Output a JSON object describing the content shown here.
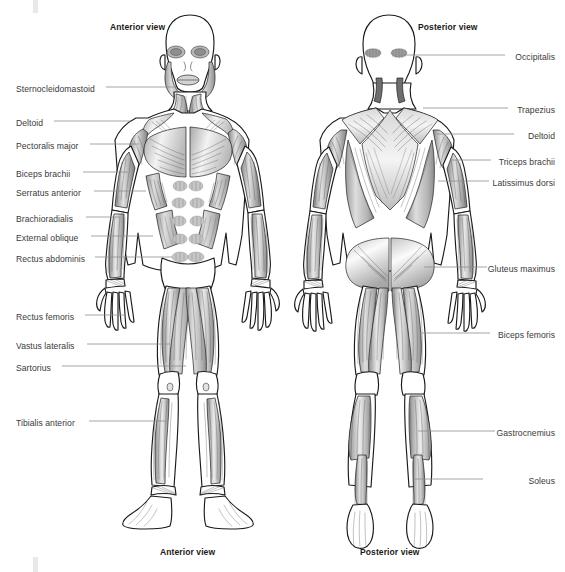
{
  "page": {
    "background_color": "#ffffff",
    "width": 565,
    "height": 572,
    "label_color": "#3a3a3a",
    "leader_line_color": "#8d8d8d",
    "outline_color": "#1a1a1a",
    "muscle_fill_light": "#f2f2f2",
    "muscle_fill_mid": "#c9c9c9",
    "muscle_fill_dark": "#8f8f8f"
  },
  "headers": {
    "anterior_top": "Anterior view",
    "posterior_top": "Posterior view"
  },
  "captions": {
    "anterior_bottom": "Anterior view",
    "posterior_bottom": "Posterior view"
  },
  "anterior_labels": [
    {
      "id": "sternocleidomastoid",
      "text": "Sternocleidomastoid",
      "x": 16,
      "y": 84,
      "line": {
        "x1": 106,
        "y1": 87,
        "x2": 176,
        "y2": 87
      }
    },
    {
      "id": "deltoid",
      "text": "Deltoid",
      "x": 16,
      "y": 118,
      "line": {
        "x1": 54,
        "y1": 121,
        "x2": 131,
        "y2": 121
      }
    },
    {
      "id": "pectoralis-major",
      "text": "Pectoralis major",
      "x": 16,
      "y": 141,
      "line": {
        "x1": 90,
        "y1": 144,
        "x2": 139,
        "y2": 144
      }
    },
    {
      "id": "biceps-brachii",
      "text": "Biceps brachii",
      "x": 16,
      "y": 169,
      "line": {
        "x1": 83,
        "y1": 172,
        "x2": 128,
        "y2": 172
      }
    },
    {
      "y_note": "",
      "id": "serratus-anterior",
      "text": "Serratus anterior",
      "x": 16,
      "y": 188,
      "line": {
        "x1": 94,
        "y1": 191,
        "x2": 143,
        "y2": 191
      }
    },
    {
      "id": "brachioradialis",
      "text": "Brachioradialis",
      "x": 16,
      "y": 214,
      "line": {
        "x1": 86,
        "y1": 217,
        "x2": 126,
        "y2": 217
      }
    },
    {
      "id": "external-oblique",
      "text": "External oblique",
      "x": 16,
      "y": 233,
      "line": {
        "x1": 91,
        "y1": 236,
        "x2": 147,
        "y2": 236
      }
    },
    {
      "id": "rectus-abdominis",
      "text": "Rectus abdominis",
      "x": 16,
      "y": 254,
      "line": {
        "x1": 95,
        "y1": 257,
        "x2": 160,
        "y2": 257
      }
    },
    {
      "id": "rectus-femoris",
      "text": "Rectus femoris",
      "x": 16,
      "y": 312,
      "line": {
        "x1": 85,
        "y1": 315,
        "x2": 125,
        "y2": 315
      }
    },
    {
      "id": "vastus-lateralis",
      "text": "Vastus lateralis",
      "x": 16,
      "y": 341,
      "line": {
        "x1": 87,
        "y1": 344,
        "x2": 153,
        "y2": 344
      }
    },
    {
      "id": "sartorius",
      "text": "Sartorius",
      "x": 16,
      "y": 363,
      "line": {
        "x1": 62,
        "y1": 366,
        "x2": 180,
        "y2": 366
      }
    },
    {
      "id": "tibialis-anterior",
      "text": "Tibialis anterior",
      "x": 16,
      "y": 418,
      "line": {
        "x1": 89,
        "y1": 421,
        "x2": 160,
        "y2": 421
      }
    }
  ],
  "posterior_labels": [
    {
      "id": "occipitalis",
      "text": "Occipitalis",
      "right": 10,
      "y": 52,
      "line": {
        "x1": 392,
        "y1": 55,
        "x2": 505,
        "y2": 55
      }
    },
    {
      "id": "trapezius",
      "text": "Trapezius",
      "right": 10,
      "y": 105,
      "line": {
        "x1": 423,
        "y1": 108,
        "x2": 508,
        "y2": 108
      }
    },
    {
      "id": "deltoid-post",
      "text": "Deltoid",
      "right": 10,
      "y": 131,
      "line": {
        "x1": 437,
        "y1": 134,
        "x2": 514,
        "y2": 134
      }
    },
    {
      "id": "triceps-brachii",
      "text": "Triceps brachii",
      "right": 10,
      "y": 157,
      "line": {
        "x1": 452,
        "y1": 160,
        "x2": 491,
        "y2": 160
      }
    },
    {
      "id": "latissimus-dorsi",
      "text": "Latissimus dorsi",
      "right": 10,
      "y": 178,
      "line": {
        "x1": 438,
        "y1": 181,
        "x2": 489,
        "y2": 181
      }
    },
    {
      "id": "gluteus-maximus",
      "text": "Gluteus maximus",
      "right": 10,
      "y": 264,
      "line": {
        "x1": 430,
        "y1": 267,
        "x2": 487,
        "y2": 267
      }
    },
    {
      "id": "biceps-femoris",
      "text": "Biceps femoris",
      "right": 10,
      "y": 330,
      "line": {
        "x1": 432,
        "y1": 333,
        "x2": 490,
        "y2": 333
      }
    },
    {
      "id": "gastrocnemius",
      "text": "Gastrocnemius",
      "right": 10,
      "y": 428,
      "line": {
        "x1": 418,
        "y1": 431,
        "x2": 495,
        "y2": 431
      }
    },
    {
      "id": "soleus",
      "text": "Soleus",
      "right": 10,
      "y": 476,
      "line": {
        "x1": 415,
        "y1": 479,
        "x2": 483,
        "y2": 479
      }
    }
  ]
}
